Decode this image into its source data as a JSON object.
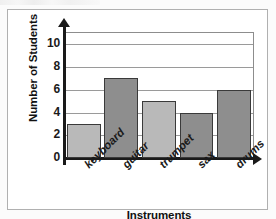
{
  "chart_data": {
    "type": "bar",
    "title": "",
    "categories": [
      "keyboard",
      "guitar",
      "trumpet",
      "sax",
      "drums"
    ],
    "values": [
      3,
      7,
      5,
      4,
      6
    ],
    "xlabel": "Instruments",
    "ylabel": "Number of Students",
    "ylim": [
      0,
      11
    ],
    "ytick_values": [
      0,
      2,
      4,
      6,
      8,
      10
    ],
    "ytick_labels": [
      "0",
      "2",
      "4",
      "6",
      "8",
      "10"
    ],
    "grid": "horizontal",
    "legend": "none",
    "bar_colors": [
      "#b9b9b9",
      "#8e8e8e",
      "#b9b9b9",
      "#8e8e8e",
      "#8e8e8e"
    ],
    "bar_edge_color": "#3a3a3a",
    "axis_color": "#1a1a1a",
    "gridline_color": "#9a9a9a",
    "plot_background": "#ffffff",
    "figure_background": "#fbfbfb",
    "frame_color": "#b0b0b0",
    "xtick_label_rotation": -45
  }
}
